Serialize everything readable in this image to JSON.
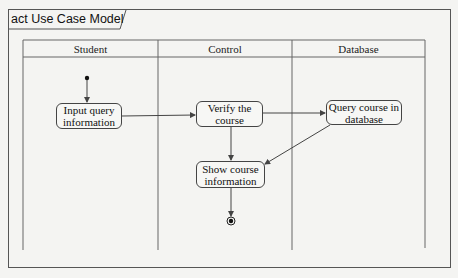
{
  "frame": {
    "title": "act Use Case Model"
  },
  "lanes": [
    {
      "label": "Student"
    },
    {
      "label": "Control"
    },
    {
      "label": "Database"
    }
  ],
  "nodes": {
    "input": {
      "label": "Input query information",
      "lane": "Student"
    },
    "verify": {
      "label": "Verify the course",
      "lane": "Control"
    },
    "query": {
      "label": "Query course in database",
      "lane": "Database"
    },
    "show": {
      "label": "Show course information",
      "lane": "Control"
    }
  },
  "flows": [
    {
      "from": "initial",
      "to": "input"
    },
    {
      "from": "input",
      "to": "verify"
    },
    {
      "from": "verify",
      "to": "query"
    },
    {
      "from": "verify",
      "to": "show"
    },
    {
      "from": "query",
      "to": "show"
    },
    {
      "from": "show",
      "to": "final"
    }
  ],
  "colors": {
    "line": "#444444",
    "background": "#f4f4f2"
  }
}
